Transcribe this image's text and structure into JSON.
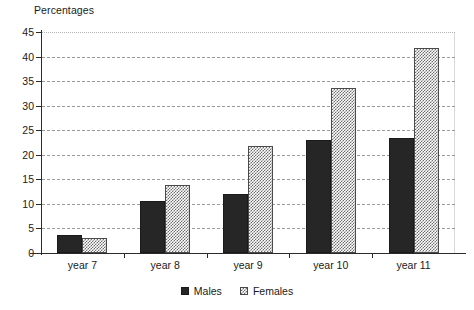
{
  "chart_data": {
    "type": "bar",
    "title": "",
    "ylabel": "Percentages",
    "xlabel": "",
    "categories": [
      "year 7",
      "year 8",
      "year 9",
      "year 10",
      "year 11"
    ],
    "series": [
      {
        "name": "Males",
        "color": "#262626",
        "fill": "solid",
        "values": [
          3.6,
          10.5,
          12.1,
          23.0,
          23.5
        ]
      },
      {
        "name": "Females",
        "color": "#6e6e6e",
        "fill": "checkerboard",
        "values": [
          3.0,
          13.8,
          21.8,
          33.5,
          41.8
        ]
      }
    ],
    "ylim": [
      0,
      45
    ],
    "yticks": [
      0,
      5,
      10,
      15,
      20,
      25,
      30,
      35,
      40,
      45
    ],
    "ytick_labels": [
      "0",
      "5",
      "10",
      "15",
      "20",
      "25",
      "30",
      "35",
      "40",
      "45"
    ],
    "grid": true,
    "grid_style": "dashed",
    "legend_position": "bottom-center",
    "legend_entries": [
      "Males",
      "Females"
    ]
  }
}
